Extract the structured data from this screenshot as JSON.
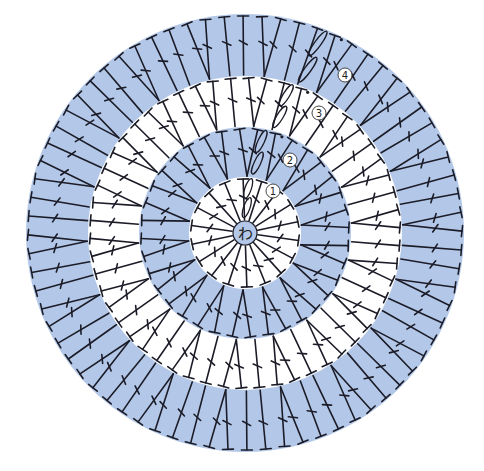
{
  "diagram": {
    "type": "crochet-chart",
    "title": "",
    "center": {
      "x": 245,
      "y": 233
    },
    "center_ring": {
      "label": "わ",
      "radius": 12,
      "fill": "#b3c8e8"
    },
    "colors": {
      "blue_ring": "#b3c8e8",
      "white_ring": "#ffffff",
      "line": "#1c1c28"
    },
    "rounds": [
      {
        "number": 1,
        "label": "①",
        "inner_radius": 12,
        "outer_radius": 56,
        "fill": "#ffffff",
        "stitch_count": 18,
        "pattern": "single",
        "start_angle_deg": -82
      },
      {
        "number": 2,
        "label": "②",
        "inner_radius": 56,
        "outer_radius": 106,
        "fill": "#b3c8e8",
        "stitch_count": 36,
        "pattern": "V",
        "start_angle_deg": -78
      },
      {
        "number": 3,
        "label": "③",
        "inner_radius": 106,
        "outer_radius": 157,
        "fill": "#ffffff",
        "stitch_count": 54,
        "pattern": "V+1",
        "start_angle_deg": -72
      },
      {
        "number": 4,
        "label": "④",
        "inner_radius": 157,
        "outer_radius": 219,
        "fill": "#b3c8e8",
        "stitch_count": 72,
        "pattern": "V+2",
        "start_angle_deg": -68
      }
    ],
    "groups_per_round": 18,
    "label_positions": [
      {
        "label": "①",
        "x": 273,
        "y": 191
      },
      {
        "label": "②",
        "x": 290,
        "y": 160
      },
      {
        "label": "③",
        "x": 319,
        "y": 113
      },
      {
        "label": "④",
        "x": 345,
        "y": 75
      }
    ]
  }
}
